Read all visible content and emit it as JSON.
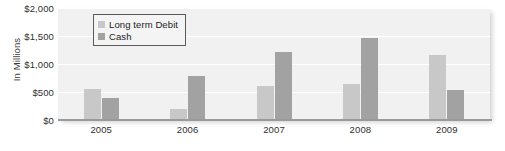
{
  "chart_data": {
    "type": "bar",
    "title": "",
    "subtitle": "",
    "xlabel": "",
    "ylabel": "In Millions",
    "categories": [
      "2005",
      "2006",
      "2007",
      "2008",
      "2009"
    ],
    "series": [
      {
        "name": "Long term Debit",
        "color": "#c8c8c8",
        "values": [
          560,
          200,
          600,
          650,
          1160
        ]
      },
      {
        "name": "Cash",
        "color": "#a2a2a2",
        "values": [
          400,
          780,
          1220,
          1460,
          530
        ]
      }
    ],
    "ylim": [
      0,
      2000
    ],
    "ytick_values": [
      0,
      500,
      1000,
      1500,
      2000
    ],
    "ytick_labels": [
      "$0",
      "$500",
      "$1,000",
      "$1,500",
      "$2,000"
    ],
    "grid": true,
    "grid_color": "#ffffff",
    "legend_position": "upper-left-inside",
    "plot_background": "#f1f1f1",
    "axis_color": "#9a9a9a"
  },
  "legend": {
    "items": [
      {
        "label": "Long term Debit"
      },
      {
        "label": "Cash"
      }
    ]
  }
}
